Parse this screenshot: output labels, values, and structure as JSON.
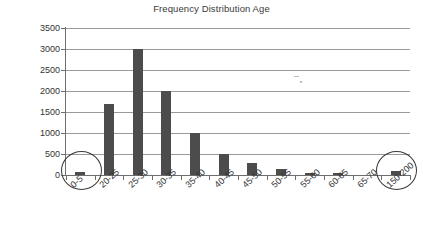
{
  "chart_data": {
    "type": "bar",
    "title": "Frequency Distribution Age",
    "xlabel": "",
    "ylabel": "",
    "categories": [
      "0-5",
      "20-25",
      "25-30",
      "30-35",
      "35-40",
      "40-45",
      "45-50",
      "50-55",
      "55-60",
      "60-65",
      "65-70",
      "150-200"
    ],
    "values": [
      70,
      1680,
      3000,
      2000,
      1000,
      500,
      290,
      150,
      45,
      30,
      0,
      90
    ],
    "ylim": [
      0,
      3500
    ],
    "ytick_labels": [
      "0",
      "500",
      "1000",
      "1500",
      "2000",
      "2500",
      "3000",
      "3500"
    ],
    "ytick_values": [
      0,
      500,
      1000,
      1500,
      2000,
      2500,
      3000,
      3500
    ],
    "grid": true,
    "legend": "none",
    "bar_color": "#4c4c4c",
    "grid_color": "#9a9a9a",
    "axis_color": "#6e6e6e",
    "text_color": "#333333",
    "background": "#ffffff",
    "annotations": [
      {
        "name": "circle-0-5",
        "shape": "ellipse",
        "target_category": "0-5",
        "note": "hand-drawn circle highlighting the 0-5 bar"
      },
      {
        "name": "circle-150-200",
        "shape": "ellipse",
        "target_category": "150-200",
        "note": "hand-drawn circle highlighting the 150-200 bar"
      }
    ]
  }
}
